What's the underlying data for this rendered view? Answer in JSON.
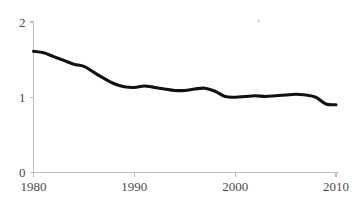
{
  "chart_data": {
    "type": "line",
    "title": "",
    "subtitle": "",
    "xlabel": "",
    "ylabel": "",
    "xlim": [
      1980,
      2010
    ],
    "ylim": [
      0,
      2
    ],
    "grid": false,
    "legend": null,
    "legend_position": "none",
    "x_ticks": [
      "1980",
      "1990",
      "2000",
      "2010"
    ],
    "x_tick_values": [
      1980,
      1990,
      2000,
      2010
    ],
    "y_ticks": [
      "0",
      "1",
      "2"
    ],
    "y_tick_values": [
      0,
      1,
      2
    ],
    "line_color": "#111111",
    "axis_color": "#bfbfbf",
    "x": [
      1980,
      1981,
      1982,
      1983,
      1984,
      1985,
      1986,
      1987,
      1988,
      1989,
      1990,
      1991,
      1992,
      1993,
      1994,
      1995,
      1996,
      1997,
      1998,
      1999,
      2000,
      2001,
      2002,
      2003,
      2004,
      2005,
      2006,
      2007,
      2008,
      2009,
      2010
    ],
    "series": [
      {
        "name": "series-1",
        "values": [
          1.61,
          1.59,
          1.54,
          1.49,
          1.44,
          1.41,
          1.33,
          1.25,
          1.18,
          1.14,
          1.13,
          1.15,
          1.13,
          1.11,
          1.09,
          1.09,
          1.11,
          1.12,
          1.08,
          1.01,
          1.0,
          1.01,
          1.02,
          1.01,
          1.02,
          1.03,
          1.04,
          1.03,
          1.0,
          0.91,
          0.9
        ]
      }
    ]
  },
  "axis_labels": {
    "y": [
      {
        "text": "2",
        "value": 2
      },
      {
        "text": "1",
        "value": 1
      },
      {
        "text": "0",
        "value": 0
      }
    ],
    "x": [
      {
        "text": "1980",
        "value": 1980
      },
      {
        "text": "1990",
        "value": 1990
      },
      {
        "text": "2000",
        "value": 2000
      },
      {
        "text": "2010",
        "value": 2010
      }
    ]
  }
}
